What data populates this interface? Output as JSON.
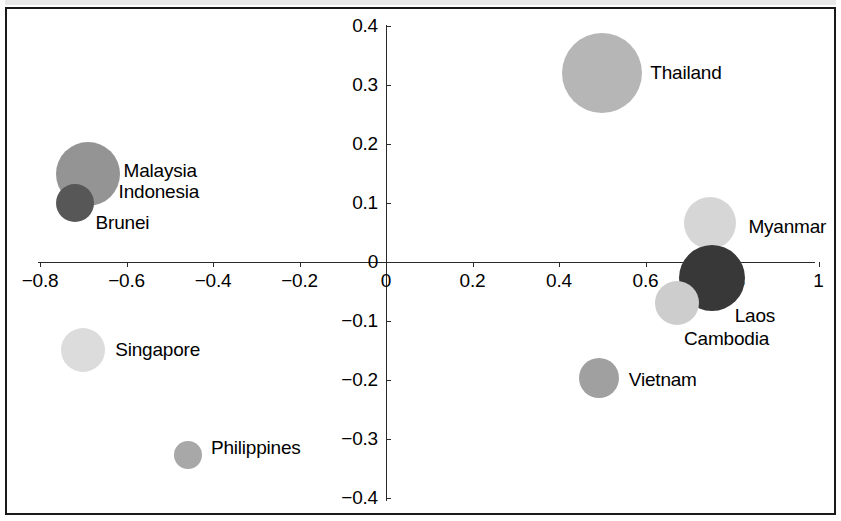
{
  "chart_data": {
    "type": "scatter",
    "title": "",
    "subtitle": "",
    "xlabel": "",
    "ylabel": "",
    "xlim": [
      -0.9,
      1.05
    ],
    "ylim": [
      -0.42,
      0.42
    ],
    "grid": false,
    "legend": "none",
    "note": "Bubble (scatter) chart of ASEAN countries; bubble area encodes a third magnitude variable; shades of grey vary by bubble.",
    "x_ticks": [
      {
        "label": "−0.8",
        "value": -0.8
      },
      {
        "label": "−0.6",
        "value": -0.6
      },
      {
        "label": "−0.4",
        "value": -0.4
      },
      {
        "label": "−0.2",
        "value": -0.2
      },
      {
        "label": "0",
        "value": 0
      },
      {
        "label": "0.2",
        "value": 0.2
      },
      {
        "label": "0.4",
        "value": 0.4
      },
      {
        "label": "0.6",
        "value": 0.6
      },
      {
        "label": "0.8",
        "value": 0.8
      },
      {
        "label": "1",
        "value": 1.0
      }
    ],
    "y_ticks": [
      {
        "label": "0.4",
        "value": 0.4
      },
      {
        "label": "0.3",
        "value": 0.3
      },
      {
        "label": "0.2",
        "value": 0.2
      },
      {
        "label": "0.1",
        "value": 0.1
      },
      {
        "label": "0",
        "value": 0
      },
      {
        "label": "−0.1",
        "value": -0.1
      },
      {
        "label": "−0.2",
        "value": -0.2
      },
      {
        "label": "−0.3",
        "value": -0.3
      },
      {
        "label": "−0.4",
        "value": -0.4
      }
    ],
    "points": [
      {
        "label": "Thailand",
        "x": 0.5,
        "y": 0.32,
        "radius_px": 40,
        "color": "#b6b6b6",
        "label_dx": 48,
        "label_dy": 0
      },
      {
        "label": "Malaysia",
        "x": -0.69,
        "y": 0.149,
        "radius_px": 32,
        "color": "#949494",
        "label_dx": 36,
        "label_dy": -3
      },
      {
        "label": "Indonesia",
        "x": -0.69,
        "y": 0.149,
        "radius_px": 0,
        "color": "transparent",
        "label_dx": 31,
        "label_dy": 18
      },
      {
        "label": "Brunei",
        "x": -0.72,
        "y": 0.1,
        "radius_px": 19,
        "color": "#575757",
        "label_dx": 21,
        "label_dy": 20
      },
      {
        "label": "Myanmar",
        "x": 0.75,
        "y": 0.066,
        "radius_px": 26,
        "color": "#d6d6d6",
        "label_dx": 38,
        "label_dy": 4
      },
      {
        "label": "Laos",
        "x": 0.753,
        "y": -0.027,
        "radius_px": 33,
        "color": "#383838",
        "label_dx": 23,
        "label_dy": 38
      },
      {
        "label": "Cambodia",
        "x": 0.673,
        "y": -0.07,
        "radius_px": 22,
        "color": "#cdcdcd",
        "label_dx": 7,
        "label_dy": 36
      },
      {
        "label": "Singapore",
        "x": -0.7,
        "y": -0.149,
        "radius_px": 22,
        "color": "#dcdcdc",
        "label_dx": 32,
        "label_dy": 0
      },
      {
        "label": "Vietnam",
        "x": 0.492,
        "y": -0.197,
        "radius_px": 20,
        "color": "#a0a0a0",
        "label_dx": 30,
        "label_dy": 2
      },
      {
        "label": "Philippines",
        "x": -0.458,
        "y": -0.327,
        "radius_px": 14,
        "color": "#a8a8a8",
        "label_dx": 23,
        "label_dy": -7
      }
    ]
  }
}
